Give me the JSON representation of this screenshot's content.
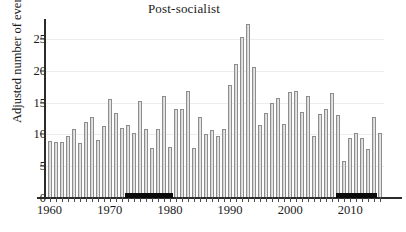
{
  "chart_data": {
    "type": "bar",
    "title": "Post-socialist",
    "xlabel": "",
    "ylabel": "Adjusted number of events",
    "ylim": [
      0,
      28
    ],
    "yticks": [
      0,
      5,
      10,
      15,
      20,
      25
    ],
    "xticks": [
      1960,
      1970,
      1980,
      1990,
      2000,
      2010
    ],
    "xlim": [
      1959.4,
      2015.6
    ],
    "grid": true,
    "legend": null,
    "categories": [
      1960,
      1961,
      1962,
      1963,
      1964,
      1965,
      1966,
      1967,
      1968,
      1969,
      1970,
      1971,
      1972,
      1973,
      1974,
      1975,
      1976,
      1977,
      1978,
      1979,
      1980,
      1981,
      1982,
      1983,
      1984,
      1985,
      1986,
      1987,
      1988,
      1989,
      1990,
      1991,
      1992,
      1993,
      1994,
      1995,
      1996,
      1997,
      1998,
      1999,
      2000,
      2001,
      2002,
      2003,
      2004,
      2005,
      2006,
      2007,
      2008,
      2009,
      2010,
      2011,
      2012,
      2013,
      2014,
      2015
    ],
    "values": [
      9.0,
      8.8,
      8.8,
      9.8,
      10.9,
      8.6,
      11.9,
      12.7,
      9.2,
      11.3,
      15.6,
      13.4,
      11.0,
      11.5,
      10.3,
      15.3,
      10.8,
      7.9,
      10.8,
      16.0,
      8.1,
      14.0,
      14.0,
      16.8,
      7.9,
      12.8,
      10.0,
      10.7,
      9.8,
      10.8,
      17.8,
      21.1,
      25.3,
      27.4,
      20.6,
      11.5,
      13.4,
      15.0,
      15.8,
      11.6,
      16.6,
      16.8,
      13.5,
      16.0,
      9.7,
      13.2,
      14.0,
      16.5,
      13.0,
      5.9,
      9.4,
      10.3,
      9.4,
      7.7,
      12.8,
      10.2
    ],
    "annotations": {
      "period_bands": [
        {
          "name": "socialist-period-band",
          "start": 1972.6,
          "end": 1980.6
        },
        {
          "name": "post-socialist-period-band",
          "start": 2007.6,
          "end": 2014.4
        }
      ]
    }
  }
}
